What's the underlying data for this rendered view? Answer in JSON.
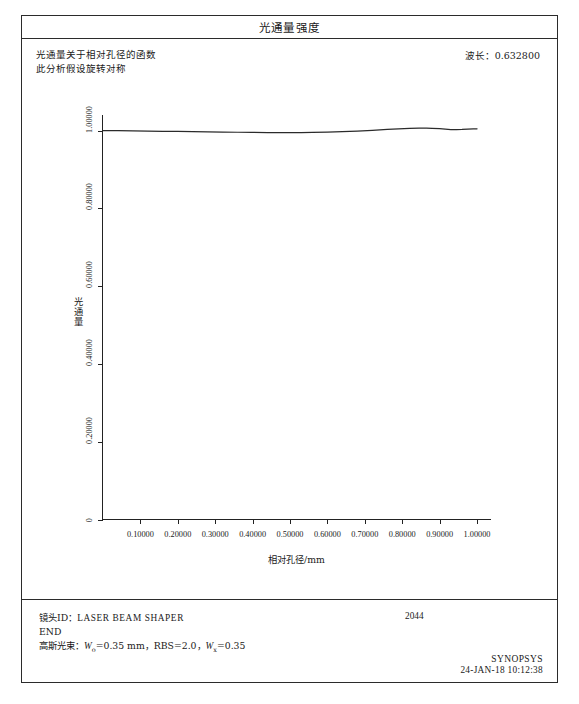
{
  "window": {
    "title": "光通量强度"
  },
  "header": {
    "description_line1": "光通量关于相对孔径的函数",
    "description_line2": "此分析假设旋转对称",
    "wavelength_label": "波长：",
    "wavelength_value": "0.632800"
  },
  "footer": {
    "lens_id_label": "镜头ID：",
    "lens_id_value": "LASER BEAM SHAPER",
    "end_marker": "END",
    "gaussian_label": "高斯光束：",
    "gaussian_w0_sym": "W",
    "gaussian_w0_sub": "o",
    "gaussian_w0_value": "=0.35 mm，",
    "gaussian_rbs": "RBS=2.0，",
    "gaussian_wx_sym": "W",
    "gaussian_wx_sub": "x",
    "gaussian_wx_value": "=0.35",
    "lens_number": "2044",
    "brand": "SYNOPSYS",
    "timestamp": "24-JAN-18 10:12:38"
  },
  "chart_data": {
    "type": "line",
    "title": "光通量强度",
    "xlabel": "相对孔径/mm",
    "ylabel": "光通量",
    "xlim": [
      0.0,
      1.04
    ],
    "ylim": [
      0.0,
      1.04
    ],
    "grid": false,
    "legend": "none",
    "x_ticks": [
      0.1,
      0.2,
      0.3,
      0.4,
      0.5,
      0.6,
      0.7,
      0.8,
      0.9,
      1.0
    ],
    "x_tick_labels": [
      "0.10000",
      "0.20000",
      "0.30000",
      "0.40000",
      "0.50000",
      "0.60000",
      "0.70000",
      "0.80000",
      "0.90000",
      "1.00000"
    ],
    "y_ticks": [
      0.0,
      0.2,
      0.4,
      0.6,
      0.8,
      1.0
    ],
    "y_tick_labels": [
      "0",
      "0.20000",
      "0.40000",
      "0.60000",
      "0.80000",
      "1.00000"
    ],
    "series": [
      {
        "name": "光通量",
        "color": "#2b2b2b",
        "x": [
          0.0,
          0.04,
          0.08,
          0.12,
          0.16,
          0.2,
          0.24,
          0.28,
          0.32,
          0.36,
          0.4,
          0.44,
          0.47,
          0.5,
          0.53,
          0.56,
          0.6,
          0.64,
          0.68,
          0.72,
          0.76,
          0.79,
          0.82,
          0.845,
          0.865,
          0.88,
          0.9,
          0.915,
          0.93,
          0.945,
          0.96,
          0.975,
          0.99,
          1.0
        ],
        "y": [
          1.0,
          0.9996,
          0.9991,
          0.9987,
          0.9982,
          0.9978,
          0.9973,
          0.9968,
          0.9963,
          0.9957,
          0.9952,
          0.9948,
          0.9946,
          0.9946,
          0.9948,
          0.9952,
          0.996,
          0.9972,
          0.9988,
          1.0008,
          1.003,
          1.0046,
          1.0058,
          1.0063,
          1.0063,
          1.0059,
          1.0048,
          1.0036,
          1.0026,
          1.0024,
          1.003,
          1.004,
          1.0046,
          1.0044
        ]
      }
    ]
  }
}
